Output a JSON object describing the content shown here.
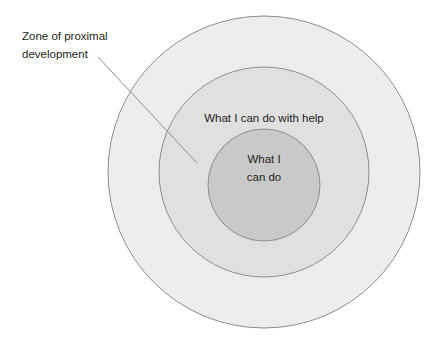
{
  "diagram": {
    "type": "concentric-circles",
    "background_color": "#ffffff",
    "stroke_color": "#8c8c8c",
    "text_color": "#231f20",
    "circles": [
      {
        "id": "outer",
        "name": "zone-of-proximal-development-circle",
        "fill": "#ededed",
        "cx": 264,
        "cy": 172,
        "r": 156,
        "label": ""
      },
      {
        "id": "middle",
        "name": "what-i-can-do-with-help-circle",
        "fill": "#e0e0e0",
        "cx": 264,
        "cy": 172,
        "r": 105,
        "label": "What I can do with help"
      },
      {
        "id": "inner",
        "name": "what-i-can-do-circle",
        "fill": "#c9c9c9",
        "cx": 264,
        "cy": 185,
        "r": 56,
        "label_line_1": "What I",
        "label_line_2": "can do"
      }
    ],
    "annotation": {
      "line_1": "Zone of proximal",
      "line_2": "development",
      "leader_line": {
        "x1": 98,
        "y1": 57,
        "x2": 197,
        "y2": 163
      }
    }
  }
}
